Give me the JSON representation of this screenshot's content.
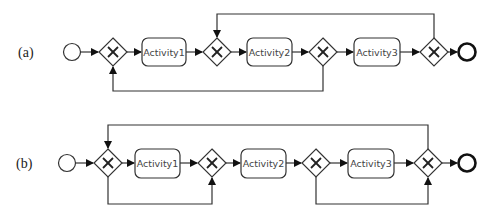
{
  "diagrams": [
    {
      "label": "(a)",
      "activities": [
        "Activity1",
        "Activity2",
        "Activity3"
      ],
      "gateways": [
        "exclusive-gateway",
        "exclusive-gateway",
        "exclusive-gateway",
        "exclusive-gateway"
      ],
      "loops": [
        {
          "from": "gateway-4",
          "to": "gateway-2",
          "route": "top"
        },
        {
          "from": "gateway-3",
          "to": "gateway-1",
          "route": "bottom"
        }
      ]
    },
    {
      "label": "(b)",
      "activities": [
        "Activity1",
        "Activity2",
        "Activity3"
      ],
      "gateways": [
        "exclusive-gateway",
        "exclusive-gateway",
        "exclusive-gateway",
        "exclusive-gateway"
      ],
      "loops": [
        {
          "from": "gateway-4",
          "to": "gateway-1",
          "route": "top"
        },
        {
          "from": "gateway-1",
          "to": "gateway-2",
          "route": "bottom"
        },
        {
          "from": "gateway-3",
          "to": "gateway-4",
          "route": "bottom"
        }
      ]
    }
  ]
}
